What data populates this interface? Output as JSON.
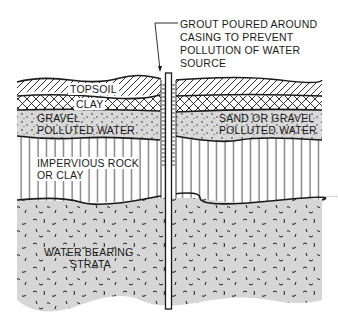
{
  "figure": {
    "type": "well-cross-section",
    "callout": {
      "lines": [
        "GROUT POURED AROUND",
        "CASING TO PREVENT",
        "POLLUTION OF WATER",
        "SOURCE"
      ]
    },
    "layers": {
      "topsoil": "TOPSOIL",
      "clay": "CLAY",
      "gravel_left_1": "GRAVEL",
      "gravel_left_2": "POLLUTED WATER",
      "gravel_right_1": "SAND OR GRAVEL",
      "gravel_right_2": "POLLUTED WATER",
      "impervious_1": "IMPERVIOUS ROCK",
      "impervious_2": "OR CLAY",
      "water_1": "WATER BEARING",
      "water_2": "STRATA"
    },
    "colors": {
      "line": "#1a1a1a",
      "gravel_fill": "#d9d9d9",
      "water_fill": "#d6d6d6",
      "background": "#ffffff"
    }
  }
}
